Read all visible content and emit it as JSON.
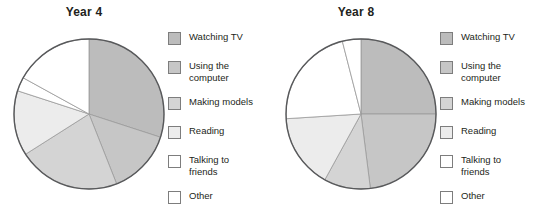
{
  "chart_data": [
    {
      "type": "pie",
      "title": "Year 4",
      "xlabel": "",
      "ylabel": "",
      "grid": false,
      "legend_position": "right",
      "categories": [
        "Watching TV",
        "Using the computer",
        "Making models",
        "Reading",
        "Talking to friends",
        "Other"
      ],
      "values": [
        30,
        14,
        22,
        14,
        3,
        17
      ],
      "units": "percent",
      "start_angle_deg": 0,
      "direction": "clockwise",
      "colors": [
        "#bcbcbc",
        "#c6c6c6",
        "#d4d4d4",
        "#ececec",
        "#ffffff",
        "#ffffff"
      ]
    },
    {
      "type": "pie",
      "title": "Year 8",
      "xlabel": "",
      "ylabel": "",
      "grid": false,
      "legend_position": "right",
      "categories": [
        "Watching TV",
        "Using the computer",
        "Making models",
        "Reading",
        "Talking to friends",
        "Other"
      ],
      "values": [
        25,
        23,
        10,
        16,
        22,
        4
      ],
      "units": "percent",
      "start_angle_deg": 0,
      "direction": "clockwise",
      "colors": [
        "#bcbcbc",
        "#c6c6c6",
        "#d4d4d4",
        "#ececec",
        "#ffffff",
        "#ffffff"
      ]
    }
  ],
  "charts": {
    "year4": {
      "title": "Year 4",
      "slices": [
        {
          "label": "Watching TV",
          "value": 30,
          "color": "#bcbcbc"
        },
        {
          "label": "Using the computer",
          "value": 14,
          "color": "#c6c6c6"
        },
        {
          "label": "Making models",
          "value": 22,
          "color": "#d4d4d4"
        },
        {
          "label": "Reading",
          "value": 14,
          "color": "#ececec"
        },
        {
          "label": "Talking to friends",
          "value": 3,
          "color": "#ffffff"
        },
        {
          "label": "Other",
          "value": 17,
          "color": "#ffffff"
        }
      ]
    },
    "year8": {
      "title": "Year 8",
      "slices": [
        {
          "label": "Watching TV",
          "value": 25,
          "color": "#bcbcbc"
        },
        {
          "label": "Using the computer",
          "value": 23,
          "color": "#c6c6c6"
        },
        {
          "label": "Making models",
          "value": 10,
          "color": "#d4d4d4"
        },
        {
          "label": "Reading",
          "value": 16,
          "color": "#ececec"
        },
        {
          "label": "Talking to friends",
          "value": 22,
          "color": "#ffffff"
        },
        {
          "label": "Other",
          "value": 4,
          "color": "#ffffff"
        }
      ]
    }
  },
  "legend": {
    "items": [
      {
        "label": "Watching TV",
        "color": "#bcbcbc",
        "multiline": false
      },
      {
        "label": "Using the\ncomputer",
        "color": "#c6c6c6",
        "multiline": true
      },
      {
        "label": "Making models",
        "color": "#d4d4d4",
        "multiline": false
      },
      {
        "label": "Reading",
        "color": "#ececec",
        "multiline": false
      },
      {
        "label": "Talking to\nfriends",
        "color": "#ffffff",
        "multiline": true
      },
      {
        "label": "Other",
        "color": "#ffffff",
        "multiline": false
      }
    ]
  },
  "style": {
    "pie_outline": "#58595b",
    "slice_divider": "#9a9a9a",
    "swatch_border": "#7d7d7d",
    "text_color": "#231f20",
    "background": "#ffffff"
  }
}
